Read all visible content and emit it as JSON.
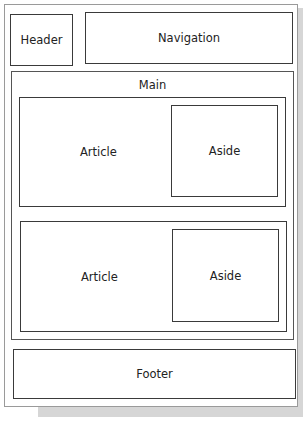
{
  "diagram": {
    "regions": {
      "header": "Header",
      "navigation": "Navigation",
      "main": "Main",
      "sections": [
        {
          "article": "Article",
          "aside": "Aside"
        },
        {
          "article": "Article",
          "aside": "Aside"
        }
      ],
      "footer": "Footer"
    }
  }
}
